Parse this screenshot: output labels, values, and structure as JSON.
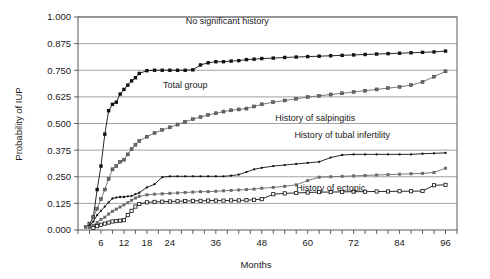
{
  "chart_data": {
    "type": "line",
    "title": "",
    "xlabel": "Months",
    "ylabel": "Probability of IUP",
    "xlim": [
      0,
      99
    ],
    "ylim": [
      0,
      1.0
    ],
    "grid": true,
    "legend_position": "inline-annotations",
    "ytick_labels": [
      "0.000",
      "0.125",
      "0.250",
      "0.375",
      "0.500",
      "0.625",
      "0.750",
      "0.875",
      "1.000"
    ],
    "ytick_values": [
      0,
      0.125,
      0.25,
      0.375,
      0.5,
      0.625,
      0.75,
      0.875,
      1.0
    ],
    "xtick_labels": [
      "6",
      "12",
      "18",
      "24",
      "36",
      "48",
      "60",
      "72",
      "84",
      "96"
    ],
    "xtick_values": [
      6,
      12,
      18,
      24,
      36,
      48,
      60,
      72,
      84,
      96
    ],
    "xtick_minor_step": 3,
    "series": [
      {
        "name": "No significant history",
        "label": "No significant history",
        "marker": "filled-square",
        "marker_size": 3.4,
        "color": "#111111",
        "label_x": 39,
        "label_y": 0.965,
        "x": [
          3,
          4,
          5,
          6,
          7,
          8,
          9,
          10,
          11,
          12,
          13,
          14,
          15,
          16,
          18,
          20,
          22,
          24,
          26,
          28,
          30,
          32,
          34,
          36,
          38,
          40,
          42,
          44,
          46,
          48,
          51,
          54,
          57,
          60,
          63,
          66,
          69,
          72,
          75,
          78,
          81,
          84,
          87,
          90,
          93,
          96
        ],
        "y": [
          0.03,
          0.06,
          0.19,
          0.3,
          0.45,
          0.56,
          0.59,
          0.6,
          0.638,
          0.66,
          0.68,
          0.7,
          0.715,
          0.735,
          0.748,
          0.75,
          0.75,
          0.75,
          0.75,
          0.75,
          0.752,
          0.775,
          0.785,
          0.79,
          0.79,
          0.793,
          0.795,
          0.8,
          0.802,
          0.805,
          0.807,
          0.81,
          0.812,
          0.814,
          0.816,
          0.818,
          0.82,
          0.822,
          0.824,
          0.826,
          0.828,
          0.83,
          0.832,
          0.834,
          0.836,
          0.84
        ]
      },
      {
        "name": "Total group",
        "label": "Total group",
        "marker": "gray-diamond",
        "marker_size": 3.0,
        "color": "#6b6b6b",
        "label_x": 28,
        "label_y": 0.665,
        "x": [
          2,
          3,
          4,
          5,
          6,
          7,
          8,
          9,
          10,
          11,
          12,
          13,
          14,
          15,
          16,
          18,
          20,
          22,
          24,
          26,
          28,
          30,
          32,
          34,
          36,
          38,
          40,
          42,
          44,
          46,
          48,
          51,
          54,
          57,
          60,
          63,
          66,
          69,
          72,
          75,
          78,
          81,
          84,
          87,
          90,
          93,
          96
        ],
        "y": [
          0.015,
          0.03,
          0.06,
          0.1,
          0.145,
          0.19,
          0.24,
          0.285,
          0.3,
          0.32,
          0.33,
          0.355,
          0.38,
          0.4,
          0.418,
          0.438,
          0.455,
          0.47,
          0.482,
          0.495,
          0.508,
          0.52,
          0.53,
          0.54,
          0.548,
          0.556,
          0.562,
          0.566,
          0.57,
          0.58,
          0.59,
          0.6,
          0.608,
          0.616,
          0.624,
          0.63,
          0.636,
          0.642,
          0.648,
          0.654,
          0.66,
          0.666,
          0.672,
          0.68,
          0.695,
          0.72,
          0.745
        ]
      },
      {
        "name": "History of tubal infertility",
        "label": "History of tubal infertility",
        "marker": "small-filled-circle",
        "marker_size": 2.3,
        "color": "#111111",
        "label_x": 69,
        "label_y": 0.432,
        "x": [
          3,
          4,
          5,
          6,
          7,
          8,
          9,
          10,
          11,
          12,
          13,
          14,
          15,
          16,
          18,
          20,
          22,
          24,
          26,
          28,
          30,
          32,
          34,
          36,
          38,
          40,
          42,
          44,
          46,
          48,
          51,
          54,
          57,
          60,
          63,
          66,
          69,
          72,
          75,
          78,
          81,
          84,
          87,
          90,
          93,
          96
        ],
        "y": [
          0.02,
          0.04,
          0.07,
          0.09,
          0.11,
          0.13,
          0.148,
          0.152,
          0.155,
          0.155,
          0.158,
          0.16,
          0.168,
          0.175,
          0.2,
          0.215,
          0.248,
          0.252,
          0.252,
          0.252,
          0.252,
          0.252,
          0.252,
          0.252,
          0.252,
          0.255,
          0.26,
          0.272,
          0.285,
          0.292,
          0.3,
          0.305,
          0.31,
          0.315,
          0.32,
          0.34,
          0.352,
          0.355,
          0.355,
          0.355,
          0.355,
          0.355,
          0.355,
          0.358,
          0.36,
          0.362
        ]
      },
      {
        "name": "History of salpingitis",
        "label": "History of salpingitis",
        "marker": "gray-square",
        "marker_size": 3.0,
        "color": "#6b6b6b",
        "label_x": 62,
        "label_y": 0.512,
        "x": [
          3,
          4,
          5,
          6,
          7,
          8,
          9,
          10,
          11,
          12,
          13,
          14,
          15,
          16,
          18,
          20,
          22,
          24,
          26,
          28,
          30,
          32,
          34,
          36,
          38,
          40,
          42,
          44,
          46,
          48,
          51,
          54,
          57,
          60,
          63,
          66,
          69,
          72,
          75,
          78,
          81,
          84,
          87,
          90,
          93,
          96
        ],
        "y": [
          0.012,
          0.022,
          0.035,
          0.05,
          0.06,
          0.075,
          0.088,
          0.098,
          0.108,
          0.118,
          0.128,
          0.14,
          0.15,
          0.158,
          0.165,
          0.168,
          0.17,
          0.172,
          0.174,
          0.176,
          0.178,
          0.18,
          0.18,
          0.182,
          0.184,
          0.186,
          0.188,
          0.19,
          0.192,
          0.196,
          0.2,
          0.205,
          0.212,
          0.232,
          0.248,
          0.25,
          0.252,
          0.254,
          0.256,
          0.258,
          0.26,
          0.262,
          0.264,
          0.266,
          0.27,
          0.29
        ]
      },
      {
        "name": "History of ectopic",
        "label": "History of ectopic",
        "marker": "open-square",
        "marker_size": 3.2,
        "color": "#111111",
        "label_x": 66,
        "label_y": 0.185,
        "x": [
          4,
          5,
          6,
          7,
          8,
          9,
          10,
          11,
          12,
          13,
          14,
          15,
          16,
          18,
          20,
          22,
          24,
          26,
          28,
          30,
          32,
          34,
          36,
          38,
          40,
          42,
          44,
          46,
          48,
          51,
          54,
          57,
          60,
          63,
          66,
          69,
          72,
          75,
          78,
          81,
          84,
          87,
          90,
          93,
          96
        ],
        "y": [
          0.01,
          0.018,
          0.025,
          0.03,
          0.035,
          0.04,
          0.042,
          0.044,
          0.046,
          0.07,
          0.09,
          0.11,
          0.122,
          0.13,
          0.132,
          0.133,
          0.134,
          0.135,
          0.136,
          0.137,
          0.137,
          0.138,
          0.138,
          0.138,
          0.139,
          0.139,
          0.14,
          0.142,
          0.145,
          0.168,
          0.172,
          0.174,
          0.176,
          0.178,
          0.178,
          0.179,
          0.18,
          0.18,
          0.181,
          0.181,
          0.182,
          0.182,
          0.183,
          0.21,
          0.212
        ]
      }
    ]
  }
}
